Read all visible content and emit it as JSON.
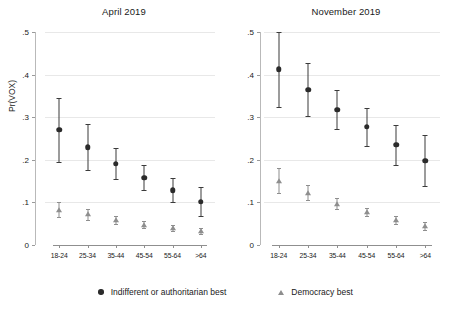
{
  "figure": {
    "ylabel": "Pr(VOX)",
    "legend": [
      {
        "marker": "filled-circle-icon",
        "label": "Indifferent or authoritarian best"
      },
      {
        "marker": "filled-triangle-icon",
        "label": "Democracy best"
      }
    ]
  },
  "chart_data": {
    "type": "scatter",
    "title": "",
    "xlabel": "",
    "ylabel": "Pr(VOX)",
    "ylim": [
      0,
      0.5
    ],
    "yticks": [
      "0",
      ".1",
      ".2",
      ".3",
      ".4",
      ".5"
    ],
    "ytick_values": [
      0,
      0.1,
      0.2,
      0.3,
      0.4,
      0.5
    ],
    "grid": true,
    "legend_position": "bottom",
    "categories": [
      "18-24",
      "25-34",
      "35-44",
      "45-54",
      "55-64",
      ">64"
    ],
    "panels": [
      {
        "title": "April 2019",
        "series": [
          {
            "name": "Indifferent or authoritarian best",
            "marker": "circle",
            "values": [
              0.27,
              0.23,
              0.191,
              0.158,
              0.128,
              0.102
            ],
            "ci_low": [
              0.195,
              0.176,
              0.156,
              0.129,
              0.1,
              0.068
            ],
            "ci_high": [
              0.345,
              0.283,
              0.227,
              0.188,
              0.157,
              0.137
            ]
          },
          {
            "name": "Democracy best",
            "marker": "triangle",
            "values": [
              0.083,
              0.072,
              0.058,
              0.048,
              0.039,
              0.032
            ],
            "ci_low": [
              0.066,
              0.059,
              0.049,
              0.041,
              0.032,
              0.025
            ],
            "ci_high": [
              0.1,
              0.085,
              0.068,
              0.056,
              0.047,
              0.04
            ]
          }
        ]
      },
      {
        "title": "November 2019",
        "series": [
          {
            "name": "Indifferent or authoritarian best",
            "marker": "circle",
            "values": [
              0.412,
              0.365,
              0.318,
              0.277,
              0.235,
              0.198
            ],
            "ci_low": [
              0.325,
              0.302,
              0.272,
              0.233,
              0.187,
              0.139
            ],
            "ci_high": [
              0.5,
              0.428,
              0.365,
              0.321,
              0.282,
              0.258
            ]
          },
          {
            "name": "Democracy best",
            "marker": "triangle",
            "values": [
              0.15,
              0.122,
              0.097,
              0.077,
              0.059,
              0.045
            ],
            "ci_low": [
              0.122,
              0.105,
              0.085,
              0.068,
              0.05,
              0.036
            ],
            "ci_high": [
              0.18,
              0.14,
              0.11,
              0.087,
              0.069,
              0.055
            ]
          }
        ]
      }
    ]
  }
}
